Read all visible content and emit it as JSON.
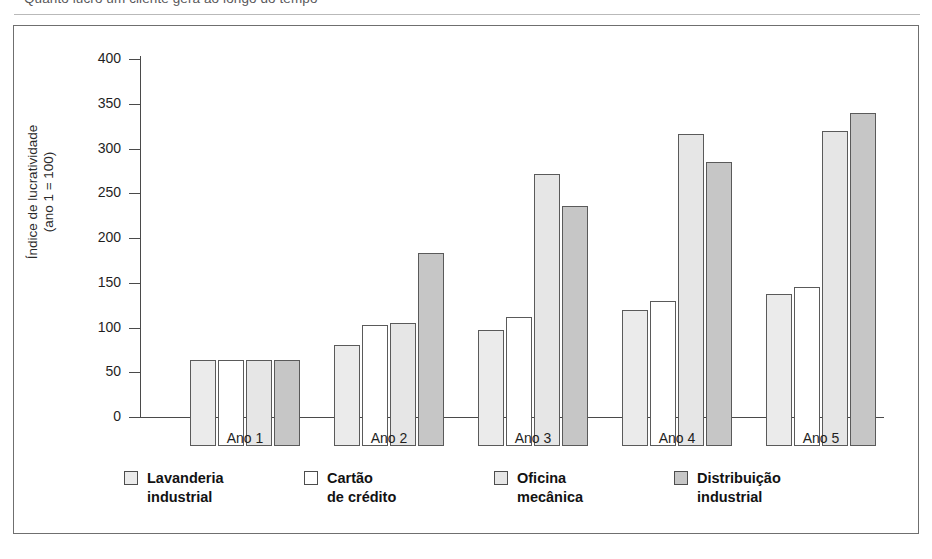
{
  "page": {
    "caption": "Quanto lucro um cliente gera ao longo do tempo"
  },
  "chart_data": {
    "type": "bar",
    "title": "Quanto lucro um cliente gera ao longo do tempo",
    "xlabel": "",
    "ylabel": "Índice de lucratividade\n(ano 1 = 100)",
    "categories": [
      "Ano 1",
      "Ano 2",
      "Ano 3",
      "Ano 4",
      "Ano 5"
    ],
    "series": [
      {
        "name": "Lavanderia\nindustrial",
        "values": [
          96,
          113,
          130,
          152,
          170
        ],
        "color": "#ebebeb"
      },
      {
        "name": "Cartão\nde crédito",
        "values": [
          96,
          135,
          144,
          162,
          178
        ],
        "color": "#ffffff"
      },
      {
        "name": "Oficina\nmecânica",
        "values": [
          96,
          137,
          304,
          349,
          352
        ],
        "color": "#e6e6e6"
      },
      {
        "name": "Distribuição\nindustrial",
        "values": [
          96,
          216,
          268,
          317,
          372
        ],
        "color": "#c6c6c6"
      }
    ],
    "ylim": [
      0,
      400
    ],
    "yticks": [
      0,
      50,
      100,
      150,
      200,
      250,
      300,
      350,
      400
    ],
    "ytick_labels": [
      "0",
      "50",
      "100",
      "150",
      "200",
      "250",
      "300",
      "350",
      "400"
    ],
    "grid": false,
    "legend_position": "bottom"
  }
}
